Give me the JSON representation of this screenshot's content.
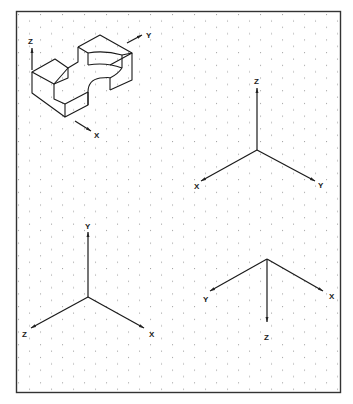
{
  "worksheet": {
    "title": "Isometric axes on isometric dot grid",
    "frame": {
      "x": 16,
      "y": 11,
      "width": 325,
      "height": 382,
      "color": "#333333"
    },
    "grid": {
      "dot_color": "#8a8a8a",
      "col_spacing": 22,
      "row_spacing": 12.7
    }
  },
  "object": {
    "name": "isometric-block-with-notch-and-curved-cutout",
    "axis_labels": {
      "z": "Z",
      "y": "Y",
      "x": "X"
    }
  },
  "triads": [
    {
      "name": "triad-top-right",
      "labels": {
        "z": "Z",
        "x": "X",
        "y": "Y"
      }
    },
    {
      "name": "triad-bottom-left",
      "labels": {
        "y": "Y",
        "z": "Z",
        "x": "X"
      }
    },
    {
      "name": "triad-bottom-right",
      "labels": {
        "y": "Y",
        "x": "X",
        "z": "Z"
      }
    }
  ]
}
